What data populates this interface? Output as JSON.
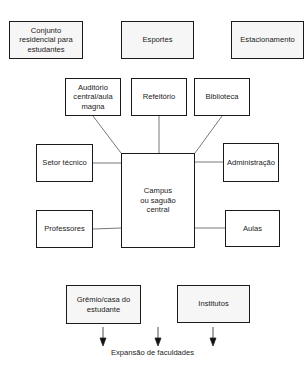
{
  "diagram": {
    "type": "hub-and-spoke campus layout",
    "top_row": [
      {
        "id": "conjunto",
        "label": "Conjunto residencial para estudantes",
        "lines": [
          "Conjunto",
          "residencial para",
          "estudantes"
        ],
        "shaded": true
      },
      {
        "id": "esportes",
        "label": "Esportes",
        "lines": [
          "Esportes"
        ],
        "shaded": true
      },
      {
        "id": "estacionamento",
        "label": "Estacionamento",
        "lines": [
          "Estacionamento"
        ],
        "shaded": true
      }
    ],
    "hub": {
      "id": "campus",
      "label": "Campus ou saguão central",
      "lines": [
        "Campus",
        "ou saguão",
        "central"
      ]
    },
    "spokes": [
      {
        "id": "auditorio",
        "label": "Auditório central/aula magna",
        "lines": [
          "Auditório",
          "central/aula",
          "magna"
        ],
        "position": "top-left"
      },
      {
        "id": "refeitorio",
        "label": "Refeitório",
        "lines": [
          "Refeitório"
        ],
        "position": "top"
      },
      {
        "id": "biblioteca",
        "label": "Biblioteca",
        "lines": [
          "Biblioteca"
        ],
        "position": "top-right"
      },
      {
        "id": "setor-tecnico",
        "label": "Setor técnico",
        "lines": [
          "Setor técnico"
        ],
        "position": "left-upper"
      },
      {
        "id": "administracao",
        "label": "Administração",
        "lines": [
          "Administração"
        ],
        "position": "right-upper"
      },
      {
        "id": "professores",
        "label": "Professores",
        "lines": [
          "Professores"
        ],
        "position": "left-lower"
      },
      {
        "id": "aulas",
        "label": "Aulas",
        "lines": [
          "Aulas"
        ],
        "position": "right-lower"
      }
    ],
    "bottom_row": [
      {
        "id": "gremio",
        "label": "Grêmio/casa do estudante",
        "lines": [
          "Grêmio/casa do",
          "estudante"
        ],
        "shaded": true
      },
      {
        "id": "institutos",
        "label": "Institutos",
        "lines": [
          "Institutos"
        ],
        "shaded": true
      }
    ],
    "expansion_arrows": 3,
    "caption": "Expansão de faculdades"
  }
}
